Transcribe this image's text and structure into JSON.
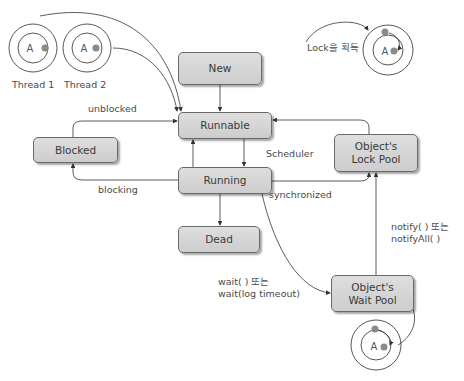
{
  "states": {
    "new": "New",
    "runnable": "Runnable",
    "running": "Running",
    "dead": "Dead",
    "blocked": "Blocked",
    "lock_pool": "Object's\nLock Pool",
    "wait_pool": "Object's\nWait Pool"
  },
  "transitions": {
    "unblocked": "unblocked",
    "blocking": "blocking",
    "scheduler": "Scheduler",
    "synchronized": "synchronized",
    "notify": "notify( ) 또는\nnotifyAll( )",
    "wait": "wait( ) 또는\nwait(log timeout)",
    "lock_acquire": "Lock을 획득"
  },
  "threads": {
    "thread1_label": "Thread 1",
    "thread2_label": "Thread 2",
    "object_letter": "A"
  },
  "colors": {
    "box_fill": "#d4d4d4",
    "box_border": "#6a6a6a",
    "line": "#333333",
    "dot": "#8a8a8a"
  }
}
